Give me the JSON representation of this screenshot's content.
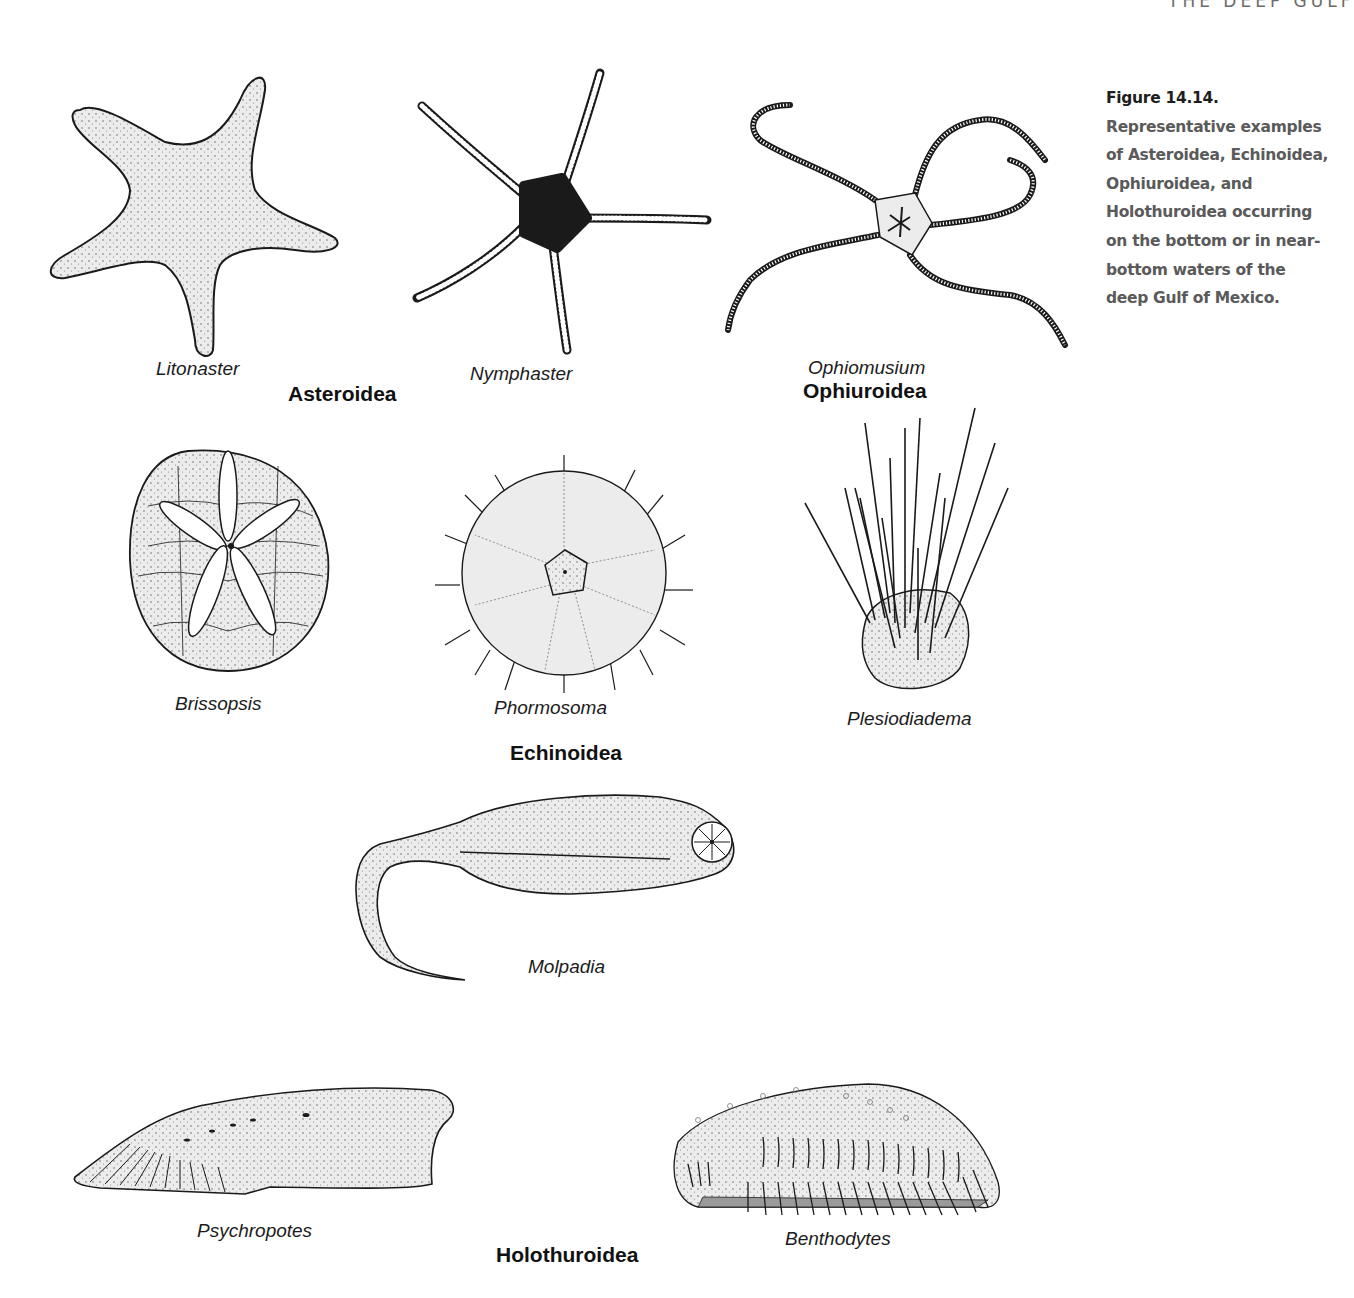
{
  "running_head": "THE DEEP GULF",
  "figure": {
    "number": "Figure 14.14.",
    "caption": "Representative examples of Asteroidea, Echinoidea, Ophiuroidea, and Holothuroidea occurring on the bottom or in near-bottom waters of the deep Gulf of Mexico."
  },
  "groups": [
    {
      "class": "Asteroidea",
      "genera": [
        "Litonaster",
        "Nymphaster"
      ]
    },
    {
      "class": "Ophiuroidea",
      "genera": [
        "Ophiomusium"
      ]
    },
    {
      "class": "Echinoidea",
      "genera": [
        "Brissopsis",
        "Phormosoma",
        "Plesiodiadema"
      ]
    },
    {
      "class": "Holothuroidea",
      "genera": [
        "Molpadia",
        "Psychropotes",
        "Benthodytes"
      ]
    }
  ],
  "labels": {
    "litonaster": "Litonaster",
    "nymphaster": "Nymphaster",
    "asteroidea": "Asteroidea",
    "ophiomusium": "Ophiomusium",
    "ophiuroidea": "Ophiuroidea",
    "brissopsis": "Brissopsis",
    "phormosoma": "Phormosoma",
    "plesiodiadema": "Plesiodiadema",
    "echinoidea": "Echinoidea",
    "molpadia": "Molpadia",
    "psychropotes": "Psychropotes",
    "benthodytes": "Benthodytes",
    "holothuroidea": "Holothuroidea"
  },
  "colors": {
    "ink": "#1a1a1a",
    "fill": "#ececec",
    "caption_text": "#5a5a5a"
  }
}
